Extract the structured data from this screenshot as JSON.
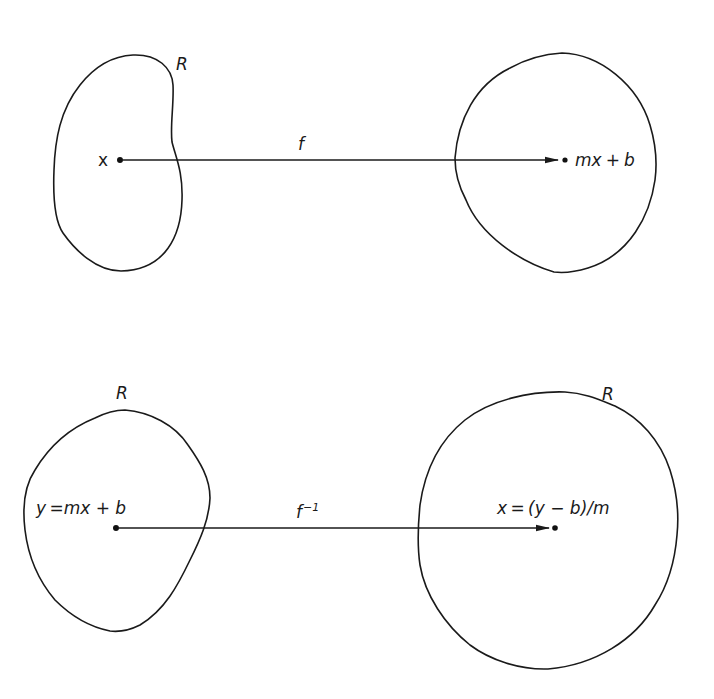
{
  "top_mapping": {
    "domain_region_label": "R",
    "domain_point_label": "x",
    "function_label": "f",
    "image_point_label_m": "m",
    "image_point_label_x": "x",
    "image_point_label_plus": "+",
    "image_point_label_b": "b"
  },
  "bottom_mapping": {
    "domain_region_label": "R",
    "codomain_region_label": "R",
    "domain_point_label": "y =mx + b",
    "function_label": "f",
    "function_superscript": "−1",
    "image_point_label": "x = (y − b)/m"
  },
  "colors": {
    "stroke": "#1a1a1a",
    "background": "#ffffff"
  }
}
